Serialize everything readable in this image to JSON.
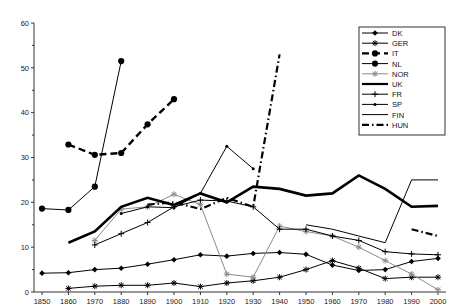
{
  "chart_data": {
    "type": "line",
    "title": "",
    "xlabel": "",
    "ylabel": "",
    "xlim": [
      1845,
      2005
    ],
    "ylim": [
      0,
      60
    ],
    "grid": false,
    "legend_position": "top-right",
    "x_ticks": [
      "1850",
      "1860",
      "1970",
      "1880",
      "1890",
      "1900",
      "1910",
      "1920",
      "1930",
      "1940",
      "1950",
      "1960",
      "1970",
      "1980",
      "1990",
      "2000"
    ],
    "x_tick_values": [
      1850,
      1860,
      1870,
      1880,
      1890,
      1900,
      1910,
      1920,
      1930,
      1940,
      1950,
      1960,
      1970,
      1980,
      1990,
      2000
    ],
    "y_ticks": [
      "0",
      "10",
      "20",
      "30",
      "40",
      "50",
      "60"
    ],
    "y_tick_values": [
      0,
      10,
      20,
      30,
      40,
      50,
      60
    ],
    "series": [
      {
        "name": "DK",
        "marker": "diamond",
        "style": "solid-thin",
        "color": "#000000",
        "x": [
          1850,
          1860,
          1870,
          1880,
          1890,
          1900,
          1910,
          1920,
          1930,
          1940,
          1950,
          1960,
          1970,
          1980,
          1990,
          2000
        ],
        "y": [
          4.2,
          4.3,
          5.0,
          5.3,
          6.2,
          7.2,
          8.3,
          8.0,
          8.6,
          8.8,
          8.4,
          6.0,
          4.8,
          5.0,
          6.8,
          7.5
        ]
      },
      {
        "name": "GER",
        "marker": "asterisk",
        "style": "solid-thin",
        "color": "#000000",
        "x": [
          1860,
          1870,
          1880,
          1890,
          1900,
          1910,
          1920,
          1930,
          1940,
          1950,
          1960,
          1970,
          1980,
          1990,
          2000
        ],
        "y": [
          0.8,
          1.3,
          1.5,
          1.5,
          2.0,
          1.2,
          2.0,
          2.5,
          3.3,
          5.0,
          7.0,
          5.3,
          3.0,
          3.3,
          3.3
        ]
      },
      {
        "name": "IT",
        "marker": "circle",
        "style": "dashed-thick",
        "color": "#000000",
        "x": [
          1860,
          1870,
          1880,
          1890,
          1900
        ],
        "y": [
          32.9,
          30.6,
          31.0,
          37.4,
          43.0
        ]
      },
      {
        "name": "NL",
        "marker": "circle",
        "style": "solid-thin",
        "color": "#000000",
        "x": [
          1850,
          1860,
          1870,
          1880
        ],
        "y": [
          18.6,
          18.3,
          23.5,
          51.5
        ]
      },
      {
        "name": "NOR",
        "marker": "asterisk",
        "style": "solid-thin-gray",
        "color": "#7f7f7f",
        "x": [
          1870,
          1880,
          1890,
          1900,
          1910,
          1920,
          1930,
          1940,
          1950,
          1960,
          1970,
          1980,
          1990,
          2000
        ],
        "y": [
          11.5,
          18.5,
          19.0,
          21.8,
          19.5,
          4.0,
          3.3,
          14.7,
          13.5,
          12.5,
          10.0,
          7.0,
          4.0,
          0.5
        ]
      },
      {
        "name": "UK",
        "marker": "none",
        "style": "solid-thick",
        "color": "#000000",
        "x": [
          1860,
          1870,
          1880,
          1890,
          1900,
          1910,
          1920,
          1930,
          1940,
          1950,
          1960,
          1970,
          1980,
          1990,
          2000
        ],
        "y": [
          11.0,
          13.5,
          19.0,
          21.0,
          19.4,
          22.0,
          20.0,
          23.5,
          23.0,
          21.5,
          22.0,
          26.0,
          23.0,
          19.0,
          19.2
        ]
      },
      {
        "name": "FR",
        "marker": "plus",
        "style": "solid-thin",
        "color": "#000000",
        "x": [
          1870,
          1880,
          1890,
          1900,
          1910,
          1920,
          1930,
          1940,
          1950,
          1960,
          1970,
          1980,
          1990,
          2000
        ],
        "y": [
          10.5,
          13.0,
          15.5,
          19.0,
          20.5,
          20.3,
          19.0,
          14.0,
          14.0,
          12.5,
          11.5,
          9.0,
          8.5,
          8.3
        ]
      },
      {
        "name": "SP",
        "marker": "dot",
        "style": "solid-thin",
        "color": "#000000",
        "x": [
          1880,
          1890,
          1900,
          1910,
          1920,
          1930
        ],
        "y": [
          17.5,
          19.0,
          18.8,
          22.0,
          32.5,
          27.5
        ]
      },
      {
        "name": "FIN",
        "marker": "none",
        "style": "solid-thin",
        "color": "#000000",
        "x": [
          1950,
          1960,
          1970,
          1980,
          1990,
          2000
        ],
        "y": [
          15.0,
          14.0,
          12.5,
          11.0,
          25.0,
          25.0
        ]
      },
      {
        "name": "HUN",
        "marker": "none",
        "style": "dash-dot-thick",
        "color": "#000000",
        "segments": [
          {
            "x": [
              1890,
              1900,
              1910,
              1920,
              1930,
              1940
            ],
            "y": [
              19.5,
              20.0,
              18.5,
              21.0,
              19.0,
              53.0
            ]
          },
          {
            "x": [
              1990,
              2000
            ],
            "y": [
              14.0,
              12.5
            ]
          }
        ]
      }
    ],
    "legend": [
      {
        "label": "DK",
        "marker": "diamond",
        "style": "solid-thin"
      },
      {
        "label": "GER",
        "marker": "asterisk",
        "style": "solid-thin"
      },
      {
        "label": "IT",
        "marker": "circle",
        "style": "dashed-thick"
      },
      {
        "label": "NL",
        "marker": "circle",
        "style": "solid-thin"
      },
      {
        "label": "NOR",
        "marker": "asterisk",
        "style": "solid-thin-gray"
      },
      {
        "label": "UK",
        "marker": "none",
        "style": "solid-thick"
      },
      {
        "label": "FR",
        "marker": "plus",
        "style": "solid-thin"
      },
      {
        "label": "SP",
        "marker": "dot",
        "style": "solid-thin"
      },
      {
        "label": "FIN",
        "marker": "none",
        "style": "solid-thin"
      },
      {
        "label": "HUN",
        "marker": "none",
        "style": "dash-dot-thick"
      }
    ]
  }
}
